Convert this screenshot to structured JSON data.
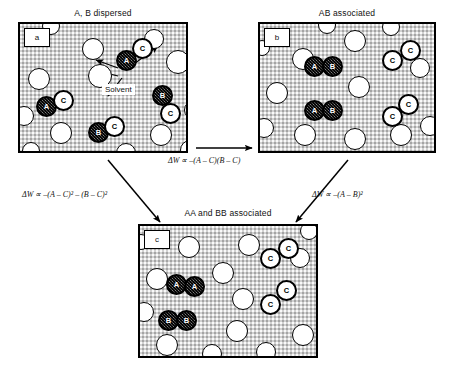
{
  "figure": {
    "type": "schematic-diagram"
  },
  "panels": [
    {
      "id": "a",
      "tag": "a",
      "title": "A, B dispersed",
      "solvent_label": "Solvent",
      "molecules": [
        {
          "kind": "solvent",
          "x": 62,
          "y": 14,
          "d": 22
        },
        {
          "kind": "solvent",
          "x": 124,
          "y": 5,
          "d": 20
        },
        {
          "kind": "solvent",
          "x": 8,
          "y": 44,
          "d": 22
        },
        {
          "kind": "solvent",
          "x": 68,
          "y": 40,
          "d": 24
        },
        {
          "kind": "solvent",
          "x": 146,
          "y": 26,
          "d": 24
        },
        {
          "kind": "solvent",
          "x": -6,
          "y": 82,
          "d": 20
        },
        {
          "kind": "solvent",
          "x": 30,
          "y": 98,
          "d": 22
        },
        {
          "kind": "solvent",
          "x": 130,
          "y": 100,
          "d": 22
        },
        {
          "kind": "solvent",
          "x": 164,
          "y": 76,
          "d": 20
        },
        {
          "kind": "solvent",
          "x": 22,
          "y": -7,
          "d": 18
        },
        {
          "kind": "solvent",
          "x": 96,
          "y": 119,
          "d": 20
        },
        {
          "kind": "solvent",
          "x": 160,
          "y": 116,
          "d": 20
        },
        {
          "kind": "solvent",
          "x": 2,
          "y": 118,
          "d": 18
        },
        {
          "kind": "abmol",
          "label": "A",
          "x": 96,
          "y": 26,
          "d": 21
        },
        {
          "kind": "cmol",
          "label": "C",
          "x": 112,
          "y": 14,
          "d": 21
        },
        {
          "kind": "abmol",
          "label": "A",
          "x": 16,
          "y": 72,
          "d": 21
        },
        {
          "kind": "cmol",
          "label": "C",
          "x": 33,
          "y": 66,
          "d": 21
        },
        {
          "kind": "abmol",
          "label": "B",
          "x": 132,
          "y": 61,
          "d": 21
        },
        {
          "kind": "cmol",
          "label": "C",
          "x": 140,
          "y": 79,
          "d": 21
        },
        {
          "kind": "abmol",
          "label": "B",
          "x": 68,
          "y": 98,
          "d": 21
        },
        {
          "kind": "cmol",
          "label": "C",
          "x": 84,
          "y": 92,
          "d": 21
        }
      ]
    },
    {
      "id": "b",
      "tag": "b",
      "title": "AB associated",
      "molecules": [
        {
          "kind": "solvent",
          "x": 32,
          "y": 24,
          "d": 22
        },
        {
          "kind": "solvent",
          "x": 84,
          "y": 6,
          "d": 22
        },
        {
          "kind": "solvent",
          "x": 6,
          "y": 58,
          "d": 22
        },
        {
          "kind": "solvent",
          "x": 88,
          "y": 52,
          "d": 22
        },
        {
          "kind": "solvent",
          "x": 150,
          "y": 34,
          "d": 20
        },
        {
          "kind": "solvent",
          "x": -6,
          "y": 94,
          "d": 20
        },
        {
          "kind": "solvent",
          "x": 34,
          "y": 100,
          "d": 22
        },
        {
          "kind": "solvent",
          "x": 84,
          "y": 104,
          "d": 22
        },
        {
          "kind": "solvent",
          "x": 130,
          "y": 100,
          "d": 22
        },
        {
          "kind": "solvent",
          "x": 160,
          "y": 92,
          "d": 20
        },
        {
          "kind": "solvent",
          "x": 58,
          "y": -8,
          "d": 18
        },
        {
          "kind": "solvent",
          "x": 122,
          "y": -6,
          "d": 18
        },
        {
          "kind": "solvent",
          "x": -6,
          "y": 16,
          "d": 16
        },
        {
          "kind": "abmol",
          "label": "A",
          "x": 44,
          "y": 32,
          "d": 21
        },
        {
          "kind": "abmol",
          "label": "B",
          "x": 62,
          "y": 32,
          "d": 21
        },
        {
          "kind": "abmol",
          "label": "A",
          "x": 44,
          "y": 76,
          "d": 21
        },
        {
          "kind": "abmol",
          "label": "B",
          "x": 62,
          "y": 76,
          "d": 21
        },
        {
          "kind": "cmol",
          "label": "C",
          "x": 122,
          "y": 26,
          "d": 21
        },
        {
          "kind": "cmol",
          "label": "C",
          "x": 140,
          "y": 16,
          "d": 21
        },
        {
          "kind": "cmol",
          "label": "C",
          "x": 122,
          "y": 82,
          "d": 21
        },
        {
          "kind": "cmol",
          "label": "C",
          "x": 138,
          "y": 70,
          "d": 21
        }
      ]
    },
    {
      "id": "c",
      "tag": "c",
      "title": "AA and BB associated",
      "molecules": [
        {
          "kind": "solvent",
          "x": 38,
          "y": 10,
          "d": 22
        },
        {
          "kind": "solvent",
          "x": 98,
          "y": 8,
          "d": 22
        },
        {
          "kind": "solvent",
          "x": 6,
          "y": 42,
          "d": 22
        },
        {
          "kind": "solvent",
          "x": 72,
          "y": 36,
          "d": 22
        },
        {
          "kind": "solvent",
          "x": 150,
          "y": 22,
          "d": 20
        },
        {
          "kind": "solvent",
          "x": -6,
          "y": 76,
          "d": 20
        },
        {
          "kind": "solvent",
          "x": 92,
          "y": 62,
          "d": 22
        },
        {
          "kind": "solvent",
          "x": 86,
          "y": 94,
          "d": 22
        },
        {
          "kind": "solvent",
          "x": 16,
          "y": 108,
          "d": 22
        },
        {
          "kind": "solvent",
          "x": 62,
          "y": 118,
          "d": 20
        },
        {
          "kind": "solvent",
          "x": 116,
          "y": 116,
          "d": 20
        },
        {
          "kind": "solvent",
          "x": 152,
          "y": 98,
          "d": 22
        },
        {
          "kind": "solvent",
          "x": 160,
          "y": -4,
          "d": 18
        },
        {
          "kind": "solvent",
          "x": -7,
          "y": 8,
          "d": 16
        },
        {
          "kind": "abmol",
          "label": "A",
          "x": 26,
          "y": 48,
          "d": 21
        },
        {
          "kind": "abmol",
          "label": "A",
          "x": 44,
          "y": 50,
          "d": 21
        },
        {
          "kind": "abmol",
          "label": "B",
          "x": 18,
          "y": 84,
          "d": 21
        },
        {
          "kind": "abmol",
          "label": "B",
          "x": 36,
          "y": 84,
          "d": 21
        },
        {
          "kind": "cmol",
          "label": "C",
          "x": 120,
          "y": 22,
          "d": 21
        },
        {
          "kind": "cmol",
          "label": "C",
          "x": 138,
          "y": 12,
          "d": 21
        },
        {
          "kind": "cmol",
          "label": "C",
          "x": 120,
          "y": 68,
          "d": 21
        },
        {
          "kind": "cmol",
          "label": "C",
          "x": 136,
          "y": 54,
          "d": 21
        }
      ]
    }
  ],
  "equations": {
    "a_to_b": "ΔW ∝ –(A – C)(B – C)",
    "a_to_c": "ΔW ∝ –(A – C)² – (B – C)²",
    "b_to_c": "ΔW ∝ –(A – B)²"
  },
  "arrows": [
    {
      "name": "arrow-a-to-b",
      "from": "panel-a",
      "to": "panel-b"
    },
    {
      "name": "arrow-a-to-c",
      "from": "panel-a",
      "to": "panel-c"
    },
    {
      "name": "arrow-b-to-c",
      "from": "panel-b",
      "to": "panel-c"
    }
  ]
}
